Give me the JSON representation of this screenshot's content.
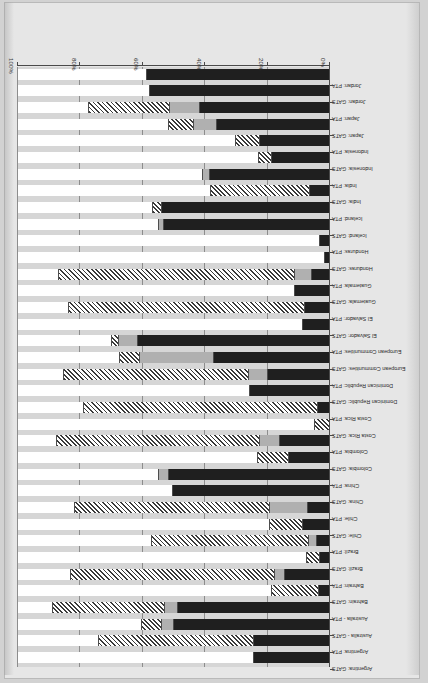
{
  "chart_data": {
    "type": "bar",
    "orientation": "horizontal-stacked",
    "title": "",
    "xlabel": "",
    "ylabel": "",
    "xlim": [
      0,
      100
    ],
    "xtick_labels": [
      "0%",
      "20%",
      "40%",
      "60%",
      "80%",
      "100%"
    ],
    "xticks": [
      0,
      20,
      40,
      60,
      80,
      100
    ],
    "grid": true,
    "legend_position": "none",
    "series": [
      {
        "name": "full-commitment-black",
        "pattern": "solid-black",
        "color": "#1f1f1f"
      },
      {
        "name": "partial-commitment-gray",
        "pattern": "solid-gray",
        "color": "#b0b0b0"
      },
      {
        "name": "limited-commitment-hatched",
        "pattern": "diagonal-hatch",
        "color": "#ffffff"
      },
      {
        "name": "no-commitment-white",
        "pattern": "solid-white",
        "color": "#ffffff"
      }
    ],
    "categories": [
      "Argentina: GATS",
      "Argentina: PTA",
      "Australia - GATS",
      "Australia - PTA",
      "Bahrain: GATS",
      "Bahrain: PTA",
      "Brazil: GATS",
      "Brazil: PTA",
      "Chile: GATS",
      "Chile: PTA",
      "China: GATS",
      "China: PTA",
      "Colombia: GATS",
      "Colombia: PTA",
      "Costa Rica: GATS",
      "Costa Rica: PTA",
      "Dominican Republic: GATS",
      "Dominican Republic: PTA",
      "European Communities: GATS",
      "European Communities: PTA",
      "El Salvador: GATS",
      "El Salvador: PTA",
      "Guatemala: GATS",
      "Guatemala: PTA",
      "Honduras: GATS",
      "Honduras: PTA",
      "Iceland: GATS",
      "Iceland: PTA",
      "India: GATS",
      "India: PTA",
      "Indonesia: GATS",
      "Indonesia: PTA",
      "Japan: GATS",
      "Japan: PTA",
      "Jordan: GATS",
      "Jordan: PTA"
    ],
    "rows": [
      {
        "label": "Argentina: GATS",
        "values": [
          24.7,
          0.0,
          0.0,
          75.3
        ]
      },
      {
        "label": "Argentina: PTA",
        "values": [
          24.7,
          0.0,
          49.7,
          25.6
        ]
      },
      {
        "label": "Australia - GATS",
        "values": [
          50.3,
          3.8,
          6.4,
          39.5
        ]
      },
      {
        "label": "Australia - PTA",
        "values": [
          49.0,
          4.2,
          35.9,
          10.9
        ]
      },
      {
        "label": "Bahrain: GATS",
        "values": [
          3.8,
          0.0,
          15.1,
          81.1
        ]
      },
      {
        "label": "Bahrain: PTA",
        "values": [
          14.7,
          3.2,
          65.4,
          16.7
        ]
      },
      {
        "label": "Brazil: GATS",
        "values": [
          3.5,
          0.0,
          4.2,
          92.3
        ]
      },
      {
        "label": "Brazil: PTA",
        "values": [
          4.5,
          2.6,
          50.3,
          42.6
        ]
      },
      {
        "label": "Chile: GATS",
        "values": [
          9.0,
          0.0,
          10.6,
          80.4
        ]
      },
      {
        "label": "Chile: PTA",
        "values": [
          7.4,
          12.2,
          62.5,
          17.9
        ]
      },
      {
        "label": "China: GATS",
        "values": [
          50.6,
          0.0,
          0.0,
          49.4
        ]
      },
      {
        "label": "China: PTA",
        "values": [
          51.9,
          3.2,
          0.0,
          44.9
        ]
      },
      {
        "label": "Colombia: GATS",
        "values": [
          13.5,
          0.0,
          9.9,
          76.6
        ]
      },
      {
        "label": "Colombia: PTA",
        "values": [
          16.3,
          6.4,
          65.1,
          12.2
        ]
      },
      {
        "label": "Costa Rica: GATS",
        "values": [
          0.0,
          0.0,
          5.1,
          94.9
        ]
      },
      {
        "label": "Costa Rica: PTA",
        "values": [
          4.2,
          0.0,
          75.0,
          20.8
        ]
      },
      {
        "label": "Dominican Republic: GATS",
        "values": [
          26.0,
          0.0,
          0.0,
          74.0
        ]
      },
      {
        "label": "Dominican Republic: PTA",
        "values": [
          20.2,
          6.1,
          59.3,
          14.4
        ]
      },
      {
        "label": "European Communities: GATS",
        "values": [
          37.5,
          23.7,
          6.4,
          32.4
        ]
      },
      {
        "label": "European Communities: PTA",
        "values": [
          61.9,
          6.1,
          2.2,
          29.8
        ]
      },
      {
        "label": "El Salvador: GATS",
        "values": [
          9.0,
          0.0,
          0.0,
          91.0
        ]
      },
      {
        "label": "El Salvador: PTA",
        "values": [
          8.3,
          0.0,
          75.6,
          16.1
        ]
      },
      {
        "label": "Guatemala: GATS",
        "values": [
          11.5,
          0.0,
          0.0,
          88.5
        ]
      },
      {
        "label": "Guatemala: PTA",
        "values": [
          6.1,
          5.4,
          75.6,
          12.9
        ]
      },
      {
        "label": "Honduras: GATS",
        "values": [
          1.9,
          0.0,
          0.0,
          98.1
        ]
      },
      {
        "label": "Honduras: PTA",
        "values": [
          3.5,
          0.0,
          0.0,
          96.5
        ]
      },
      {
        "label": "Iceland: GATS",
        "values": [
          53.5,
          1.6,
          0.0,
          44.9
        ]
      },
      {
        "label": "Iceland: PTA",
        "values": [
          54.2,
          0.0,
          2.9,
          42.9
        ]
      },
      {
        "label": "India: GATS",
        "values": [
          6.7,
          0.0,
          31.7,
          61.6
        ]
      },
      {
        "label": "India: PTA",
        "values": [
          38.8,
          2.2,
          0.0,
          59.0
        ]
      },
      {
        "label": "Indonesia: GATS",
        "values": [
          18.9,
          0.0,
          4.2,
          76.9
        ]
      },
      {
        "label": "Indonesia: PTA",
        "values": [
          22.8,
          0.0,
          7.7,
          69.5
        ]
      },
      {
        "label": "Japan: GATS",
        "values": [
          36.5,
          7.4,
          8.0,
          48.1
        ]
      },
      {
        "label": "Japan: PTA",
        "values": [
          42.0,
          9.6,
          26.0,
          22.4
        ]
      },
      {
        "label": "Jordan: GATS",
        "values": [
          58.0,
          0.0,
          0.0,
          42.0
        ]
      },
      {
        "label": "Jordan: PTA",
        "values": [
          59.0,
          0.0,
          0.0,
          41.0
        ]
      }
    ]
  }
}
